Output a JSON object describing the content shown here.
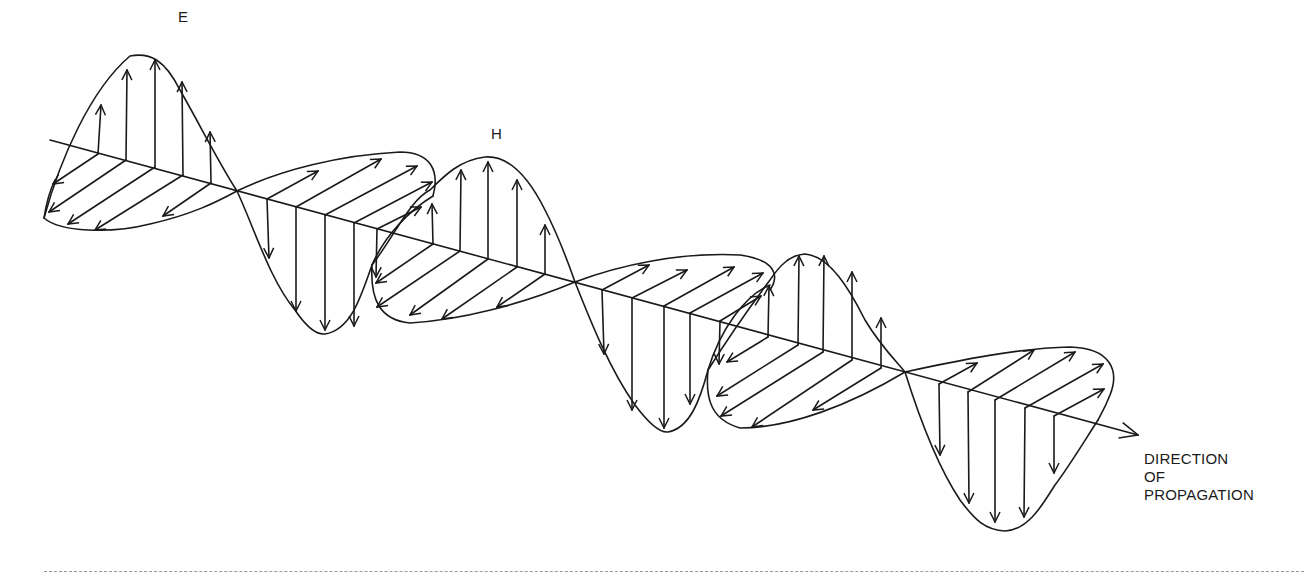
{
  "labels": {
    "e_field": "E",
    "h_field": "H",
    "direction_line1": "DIRECTION",
    "direction_line2": "OF",
    "direction_line3": "PROPAGATION"
  },
  "colors": {
    "stroke": "#1a1a1a",
    "background": "#ffffff",
    "divider": "#999999"
  },
  "geometry": {
    "axis_start": [
      50,
      140
    ],
    "axis_end": [
      1140,
      435
    ],
    "e_lobes": [
      {
        "from_x": 45,
        "to_x": 237,
        "dir": "up",
        "peak": [
          130,
          55
        ]
      },
      {
        "from_x": 237,
        "to_x": 433,
        "dir": "down",
        "peak": [
          320,
          335
        ]
      },
      {
        "from_x": 433,
        "to_x": 575,
        "dir": "up",
        "peak": [
          488,
          158
        ]
      },
      {
        "from_x": 575,
        "to_x": 770,
        "dir": "down",
        "peak": [
          660,
          432
        ]
      },
      {
        "from_x": 770,
        "to_x": 905,
        "dir": "up",
        "peak": [
          800,
          253
        ]
      },
      {
        "from_x": 905,
        "to_x": 1110,
        "dir": "down",
        "peak": [
          1003,
          530
        ]
      }
    ],
    "h_lobes": [
      {
        "dir": "down-left",
        "region": "x 45-237"
      },
      {
        "dir": "up-right",
        "region": "x 237-433"
      },
      {
        "dir": "down-left",
        "region": "x 370-575"
      },
      {
        "dir": "up-right",
        "region": "x 575-770"
      },
      {
        "dir": "down-left",
        "region": "x 710-905"
      },
      {
        "dir": "up-right",
        "region": "x 905-1115"
      }
    ]
  }
}
